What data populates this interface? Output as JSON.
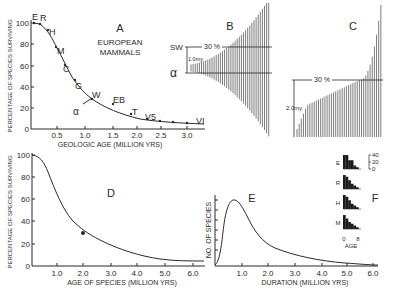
{
  "chart_data": [
    {
      "panel": "A",
      "type": "line",
      "title": "EUROPEAN MAMMALS",
      "panel_label": "A",
      "xlabel": "GEOLOGIC AGE (MILLION YRS)",
      "ylabel": "PERCENTAGE OF SPECIES SURVIVING",
      "xlim": [
        0,
        3.3
      ],
      "ylim": [
        0,
        100
      ],
      "x_ticks": [
        "0.5",
        "1.0",
        "1.5",
        "2.0",
        "2.5",
        "3.0"
      ],
      "y_ticks": [
        "0",
        "20",
        "40",
        "60",
        "80",
        "100"
      ],
      "points": [
        {
          "label": "E",
          "x": 0.05,
          "y": 100
        },
        {
          "label": "R",
          "x": 0.2,
          "y": 99
        },
        {
          "label": "H",
          "x": 0.35,
          "y": 85
        },
        {
          "label": "M",
          "x": 0.48,
          "y": 71
        },
        {
          "label": "C",
          "x": 0.65,
          "y": 52
        },
        {
          "label": "G",
          "x": 0.85,
          "y": 37
        },
        {
          "label": "W",
          "x": 1.1,
          "y": 27
        },
        {
          "label": "EB",
          "x": 1.5,
          "y": 25
        },
        {
          "label": "T",
          "x": 1.9,
          "y": 15
        },
        {
          "label": "V5",
          "x": 2.2,
          "y": 10
        },
        {
          "label": "",
          "x": 2.45,
          "y": 8
        },
        {
          "label": "",
          "x": 2.65,
          "y": 7
        },
        {
          "label": "",
          "x": 2.9,
          "y": 7
        },
        {
          "label": "VI",
          "x": 3.1,
          "y": 7
        }
      ],
      "annotations": [
        {
          "label": "α",
          "x": 0.95,
          "y": 23,
          "pointer_to": {
            "x": 1.02,
            "y": 29
          }
        }
      ]
    },
    {
      "panel": "B",
      "type": "bar",
      "panel_label": "B",
      "description": "Vertical species-range bars increasing in length to the right",
      "annotations": [
        "SW",
        "α",
        "1.0my",
        "30 %"
      ]
    },
    {
      "panel": "C",
      "type": "bar",
      "panel_label": "C",
      "description": "Vertical species-duration bars sorted ascending",
      "annotations": [
        "30 %",
        "2.0my"
      ]
    },
    {
      "panel": "D",
      "type": "line",
      "panel_label": "D",
      "xlabel": "AGE OF SPECIES (MILLION YRS)",
      "ylabel": "PERCENTAGE OF SPECIES SURVIVING",
      "xlim": [
        0,
        6.0
      ],
      "ylim": [
        0,
        100
      ],
      "x_ticks": [
        "1.0",
        "2.0",
        "3.0",
        "4.0",
        "5.0",
        "6.0"
      ],
      "y_ticks": [
        "0",
        "20",
        "40",
        "60",
        "80",
        "100"
      ],
      "x": [
        0,
        0.25,
        0.5,
        0.75,
        1.0,
        1.25,
        1.5,
        1.75,
        2.0,
        2.5,
        3.0,
        3.5,
        4.0,
        4.5,
        5.0,
        5.5,
        6.0
      ],
      "y": [
        100,
        98,
        90,
        77,
        63,
        51,
        41,
        35,
        30,
        23,
        17,
        12,
        9,
        7,
        6,
        5.5,
        5
      ],
      "marker": {
        "x": 2.0,
        "y": 30
      }
    },
    {
      "panel": "E",
      "type": "line",
      "panel_label": "E",
      "xlabel": "DURATION (MILLION YRS)",
      "ylabel": "NO. OF SPECIES",
      "xlim": [
        0,
        6.0
      ],
      "x_ticks": [
        "1.0",
        "2.0",
        "3.0",
        "4.0",
        "5.0",
        "6.0"
      ],
      "x": [
        0,
        0.2,
        0.4,
        0.6,
        0.75,
        1.0,
        1.25,
        1.5,
        2.0,
        2.5,
        3.0,
        4.0,
        5.0,
        6.0
      ],
      "y": [
        0,
        15,
        45,
        58,
        60,
        55,
        44,
        35,
        22,
        15,
        11,
        6,
        3,
        1
      ]
    },
    {
      "panel": "F",
      "type": "bar",
      "panel_label": "F",
      "xlabel": "AGE",
      "x_ticks": [
        "0",
        "8"
      ],
      "y_ticks": [
        "0",
        "20",
        "40"
      ],
      "rows": [
        {
          "label": "E",
          "values": [
            40,
            40,
            25,
            25,
            10,
            5
          ]
        },
        {
          "label": "R",
          "values": [
            40,
            35,
            25,
            15,
            10,
            5
          ]
        },
        {
          "label": "H",
          "values": [
            40,
            35,
            25,
            15,
            10,
            5
          ]
        },
        {
          "label": "M",
          "values": [
            40,
            30,
            20,
            15,
            10,
            5
          ]
        }
      ]
    }
  ],
  "labels": {
    "A": {
      "panel": "A",
      "title1": "EUROPEAN",
      "title2": "MAMMALS",
      "xlabel": "GEOLOGIC AGE (MILLION YRS)",
      "ylabel": "PERCENTAGE OF SPECIES SURVIVING",
      "alpha": "α",
      "xticks": [
        "0.5",
        "1.0",
        "1.5",
        "2.0",
        "2.5",
        "3.0"
      ],
      "yticks": [
        "0",
        "20",
        "40",
        "60",
        "80",
        "100"
      ],
      "pts": [
        "E",
        "R",
        "H",
        "M",
        "C",
        "G",
        "W",
        "EB",
        "T",
        "V5",
        "VI"
      ]
    },
    "B": {
      "panel": "B",
      "sw": "SW",
      "alpha": "α",
      "my": "1.0my",
      "pct": "30 %"
    },
    "C": {
      "panel": "C",
      "pct": "30 %",
      "my": "2.0my"
    },
    "D": {
      "panel": "D",
      "xlabel": "AGE OF SPECIES (MILLION YRS)",
      "ylabel": "PERCENTAGE OF SPECIES SURVIVING",
      "xticks": [
        "1.0",
        "2.0",
        "3.0",
        "4.0",
        "5.0",
        "6.0"
      ],
      "yticks": [
        "0",
        "20",
        "40",
        "60",
        "80",
        "100"
      ]
    },
    "E": {
      "panel": "E",
      "xlabel": "DURATION (MILLION YRS)",
      "ylabel": "NO. OF SPECIES",
      "xticks": [
        "1.0",
        "2.0",
        "3.0",
        "4.0",
        "5.0",
        "6.0"
      ]
    },
    "F": {
      "panel": "F",
      "rows": [
        "E",
        "R",
        "H",
        "M"
      ],
      "yticks": [
        "40",
        "20",
        "0"
      ],
      "x0": "0",
      "x1": "8",
      "xlabel": "AGE"
    }
  },
  "colors": {
    "ink": "#2a2a2a",
    "background": "#ffffff"
  }
}
